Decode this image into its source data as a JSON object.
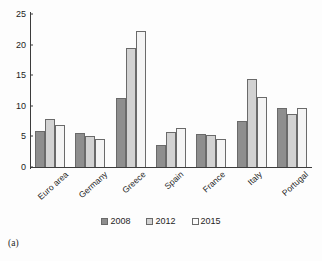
{
  "caption": "(a)",
  "legend": {
    "position": "bottom-center",
    "entries": [
      {
        "label": "2008",
        "color": "#8e8e8e"
      },
      {
        "label": "2012",
        "color": "#d2d2d2"
      },
      {
        "label": "2015",
        "color": "#fbfbfb"
      }
    ]
  },
  "axis": {
    "yticks": [
      "0",
      "5",
      "10",
      "15",
      "20",
      "25"
    ]
  },
  "chart_data": {
    "type": "bar",
    "title": "",
    "xlabel": "",
    "ylabel": "",
    "ylim": [
      0,
      25
    ],
    "ytick_values": [
      0,
      5,
      10,
      15,
      20,
      25
    ],
    "grid": false,
    "legend_position": "bottom-center",
    "categories": [
      "Euro area",
      "Germany",
      "Greece",
      "Spain",
      "France",
      "Italy",
      "Portugal"
    ],
    "series": [
      {
        "name": "2008",
        "color": "#8e8e8e",
        "values": [
          5.9,
          5.5,
          11.2,
          3.6,
          5.4,
          7.5,
          9.7
        ]
      },
      {
        "name": "2012",
        "color": "#d2d2d2",
        "values": [
          7.8,
          5.0,
          19.5,
          5.8,
          5.3,
          14.4,
          8.6
        ]
      },
      {
        "name": "2015",
        "color": "#f4f4f4",
        "values": [
          6.9,
          4.5,
          22.2,
          6.4,
          4.5,
          11.4,
          9.6
        ]
      }
    ]
  }
}
